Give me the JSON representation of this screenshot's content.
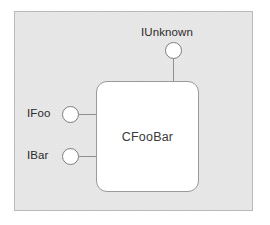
{
  "diagram": {
    "type": "com-component-diagram",
    "panel": {
      "background_color": "#e4e4e4",
      "border_color": "#b9b9b9"
    },
    "component": {
      "name": "CFooBar",
      "fill_color": "#ffffff",
      "border_color": "#9a9a9a"
    },
    "interfaces": [
      {
        "name": "IUnknown",
        "position": "top",
        "connector": "lollipop"
      },
      {
        "name": "IFoo",
        "position": "left",
        "connector": "lollipop"
      },
      {
        "name": "IBar",
        "position": "left",
        "connector": "lollipop"
      }
    ],
    "connector_color": "#8f8f8f",
    "label_color": "#2b2b2b"
  }
}
